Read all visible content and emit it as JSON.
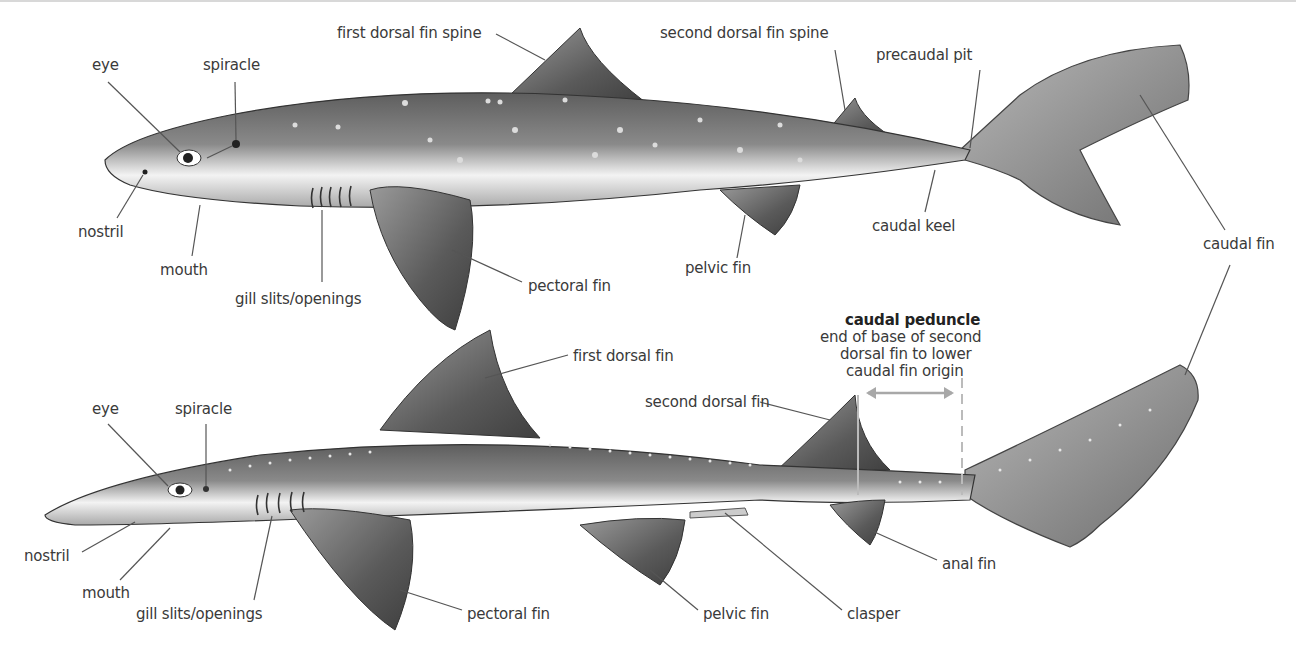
{
  "diagram": {
    "type": "shark-anatomy",
    "upper_shark": {
      "labels": [
        {
          "id": "eye",
          "text": "eye",
          "x": 92,
          "y": 56
        },
        {
          "id": "spiracle",
          "text": "spiracle",
          "x": 203,
          "y": 56
        },
        {
          "id": "first-dorsal-fin-spine",
          "text": "first dorsal fin spine",
          "x": 337,
          "y": 24
        },
        {
          "id": "second-dorsal-fin-spine",
          "text": "second dorsal fin spine",
          "x": 660,
          "y": 24
        },
        {
          "id": "precaudal-pit",
          "text": "precaudal pit",
          "x": 876,
          "y": 46
        },
        {
          "id": "nostril",
          "text": "nostril",
          "x": 78,
          "y": 223
        },
        {
          "id": "mouth",
          "text": "mouth",
          "x": 160,
          "y": 261
        },
        {
          "id": "gill-slits",
          "text": "gill slits/openings",
          "x": 235,
          "y": 290
        },
        {
          "id": "pectoral-fin",
          "text": "pectoral fin",
          "x": 528,
          "y": 277
        },
        {
          "id": "pelvic-fin",
          "text": "pelvic fin",
          "x": 685,
          "y": 259
        },
        {
          "id": "caudal-keel",
          "text": "caudal keel",
          "x": 872,
          "y": 217
        },
        {
          "id": "caudal-fin",
          "text": "caudal fin",
          "x": 1203,
          "y": 235
        }
      ]
    },
    "lower_shark": {
      "labels": [
        {
          "id": "eye",
          "text": "eye",
          "x": 92,
          "y": 400
        },
        {
          "id": "spiracle",
          "text": "spiracle",
          "x": 175,
          "y": 400
        },
        {
          "id": "first-dorsal-fin",
          "text": "first dorsal fin",
          "x": 573,
          "y": 347
        },
        {
          "id": "second-dorsal-fin",
          "text": "second dorsal fin",
          "x": 645,
          "y": 393
        },
        {
          "id": "nostril",
          "text": "nostril",
          "x": 24,
          "y": 547
        },
        {
          "id": "mouth",
          "text": "mouth",
          "x": 82,
          "y": 584
        },
        {
          "id": "gill-slits",
          "text": "gill slits/openings",
          "x": 136,
          "y": 605
        },
        {
          "id": "pectoral-fin",
          "text": "pectoral fin",
          "x": 467,
          "y": 605
        },
        {
          "id": "pelvic-fin",
          "text": "pelvic fin",
          "x": 703,
          "y": 605
        },
        {
          "id": "clasper",
          "text": "clasper",
          "x": 847,
          "y": 605
        },
        {
          "id": "anal-fin",
          "text": "anal fin",
          "x": 942,
          "y": 555
        }
      ],
      "caudal_peduncle": {
        "title": "caudal peduncle",
        "lines": [
          "end of base of second",
          "dorsal fin to lower",
          "caudal fin origin"
        ],
        "x": 845,
        "y": 311
      }
    }
  },
  "colors": {
    "label_text": "#3a3a3a",
    "leader_line": "#555555",
    "measure_arrow": "#a8a8a8",
    "body_dark": "#6b6b6b",
    "body_light": "#f2f2f2"
  }
}
